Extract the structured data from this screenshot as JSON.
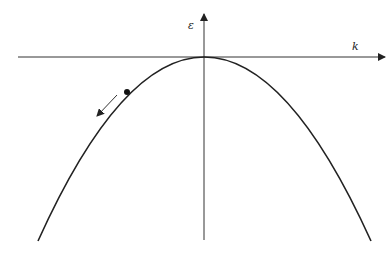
{
  "diagram": {
    "type": "band-dispersion",
    "axes": {
      "vertical_label": "ε",
      "horizontal_label": "k"
    },
    "curve": "inverted parabola (hole band maximum at k=0)",
    "marker": "electron state dot on left branch",
    "arrow": "direction of motion down the left branch",
    "colors": {
      "line": "#222222",
      "background": "#ffffff"
    }
  }
}
